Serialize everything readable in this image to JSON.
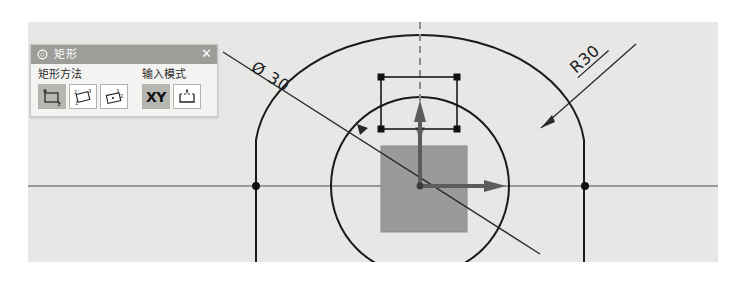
{
  "app": {
    "canvas_background": "#e7e7e5",
    "page_background": "#ffffff"
  },
  "dialog": {
    "title": "矩形",
    "title_bar_color": "#9d9d9a",
    "gear_icon": "gear-icon",
    "close_label": "✕",
    "groups": [
      {
        "label": "矩形方法",
        "buttons": [
          {
            "icon": "rectangle-by-2-corners-icon",
            "selected": true,
            "label": ""
          },
          {
            "icon": "rectangle-by-3-points-icon",
            "selected": false,
            "label": ""
          },
          {
            "icon": "rectangle-from-center-icon",
            "selected": false,
            "label": ""
          }
        ]
      },
      {
        "label": "输入模式",
        "buttons": [
          {
            "icon": "xy-coordinate-icon",
            "selected": true,
            "label": "XY"
          },
          {
            "icon": "dimension-input-icon",
            "selected": false,
            "label": ""
          }
        ]
      }
    ]
  },
  "drawing": {
    "dimensions": [
      {
        "name": "diameter-dimension",
        "text": "Ø 30",
        "value": 30,
        "symbol": "Ø",
        "rotation_deg": 37
      },
      {
        "name": "radius-dimension",
        "text": "R30",
        "value": 30,
        "symbol": "R",
        "rotation_deg": -37
      }
    ],
    "axes": [
      {
        "name": "x-axis-arrow",
        "direction": "right",
        "color": "#5c5c5c"
      },
      {
        "name": "y-axis-arrow",
        "direction": "up",
        "color": "#5c5c5c"
      }
    ],
    "entities": [
      {
        "name": "construction-circle",
        "type": "circle",
        "stroke": "#1a1a1a"
      },
      {
        "name": "outer-profile",
        "type": "arc-and-lines",
        "stroke": "#1a1a1a"
      },
      {
        "name": "preview-rectangle",
        "type": "rectangle",
        "stroke": "#1a1a1a",
        "handles": 4
      },
      {
        "name": "filled-square",
        "type": "rectangle",
        "fill": "#9a9a98"
      },
      {
        "name": "vertical-centerline",
        "type": "dashed-line",
        "stroke": "#8d8d8d"
      },
      {
        "name": "horizontal-axis-line",
        "type": "line",
        "stroke": "#4a4a4a"
      }
    ],
    "snap_points": [
      {
        "name": "snap-point-left",
        "x": 256,
        "y": 186
      },
      {
        "name": "snap-point-right",
        "x": 585,
        "y": 186
      }
    ]
  }
}
